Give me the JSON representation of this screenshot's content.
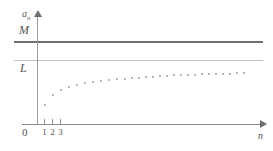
{
  "figure": {
    "title": "",
    "y_axis_label": "a",
    "y_axis_label_sub": "n",
    "x_axis_label": "n",
    "origin_label": "0",
    "bound_label_upper": "M",
    "bound_label_limit": "L",
    "x_tick_labels": [
      "1",
      "2",
      "3"
    ]
  },
  "colors": {
    "axis": "#8a8a8a",
    "m_line": "#6f6f6f",
    "l_line": "#c2c2c2",
    "dot": "#9d9d9d",
    "label": "#555555",
    "background": "#ffffff"
  },
  "chart_data": {
    "type": "scatter",
    "title": "",
    "xlabel": "n",
    "ylabel": "a_n",
    "xlim": [
      0,
      29
    ],
    "ylim": [
      0,
      1.25
    ],
    "grid": false,
    "legend": null,
    "annotations": [
      {
        "text": "M",
        "type": "horizontal-line",
        "y": 1.0,
        "note": "upper bound"
      },
      {
        "text": "L",
        "type": "horizontal-line",
        "y": 0.78,
        "note": "limit of sequence"
      }
    ],
    "x": [
      1,
      2,
      3,
      4,
      5,
      6,
      7,
      8,
      9,
      10,
      11,
      12,
      13,
      14,
      15,
      16,
      17,
      18,
      19,
      20,
      21,
      22,
      23,
      24,
      25,
      26,
      27,
      28
    ],
    "values": [
      0.25,
      0.44,
      0.53,
      0.58,
      0.615,
      0.64,
      0.66,
      0.675,
      0.688,
      0.699,
      0.708,
      0.716,
      0.722,
      0.728,
      0.733,
      0.737,
      0.741,
      0.744,
      0.747,
      0.75,
      0.752,
      0.754,
      0.756,
      0.758,
      0.759,
      0.761,
      0.762,
      0.763
    ],
    "series": [
      {
        "name": "a_n",
        "values": [
          0.25,
          0.44,
          0.53,
          0.58,
          0.615,
          0.64,
          0.66,
          0.675,
          0.688,
          0.699,
          0.708,
          0.716,
          0.722,
          0.728,
          0.733,
          0.737,
          0.741,
          0.744,
          0.747,
          0.75,
          0.752,
          0.754,
          0.756,
          0.758,
          0.759,
          0.761,
          0.762,
          0.763
        ]
      }
    ],
    "x_pixels": [
      44,
      52,
      60,
      68,
      76,
      84,
      92,
      100,
      108,
      116,
      124,
      131,
      138,
      145,
      152,
      159,
      166,
      173,
      180,
      187,
      194,
      201,
      208,
      215,
      222,
      229,
      236,
      243
    ],
    "y_pixels": [
      104,
      94,
      89,
      86,
      84,
      82,
      81,
      80,
      79,
      78,
      77.5,
      77,
      76.5,
      76,
      75.5,
      75,
      74.7,
      74.4,
      74.1,
      73.8,
      73.6,
      73.4,
      73.2,
      73,
      72.8,
      72.6,
      72.4,
      72.2
    ]
  }
}
